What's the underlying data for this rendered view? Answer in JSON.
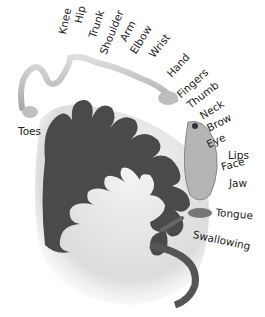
{
  "diagram": {
    "colors": {
      "cortex": "#4a4a4a",
      "brain_fill": "#e6e6e6",
      "body_figure": "#c9c9c9",
      "label": "#222222"
    },
    "labels": [
      {
        "id": "knee",
        "text": "Knee"
      },
      {
        "id": "hip",
        "text": "Hip"
      },
      {
        "id": "trunk",
        "text": "Trunk"
      },
      {
        "id": "shoulder",
        "text": "Shoulder"
      },
      {
        "id": "arm",
        "text": "Arm"
      },
      {
        "id": "elbow",
        "text": "Elbow"
      },
      {
        "id": "wrist",
        "text": "Wrist"
      },
      {
        "id": "hand",
        "text": "Hand"
      },
      {
        "id": "fingers",
        "text": "Fingers"
      },
      {
        "id": "thumb",
        "text": "Thumb"
      },
      {
        "id": "neck",
        "text": "Neck"
      },
      {
        "id": "brow",
        "text": "Brow"
      },
      {
        "id": "eye",
        "text": "Eye"
      },
      {
        "id": "face",
        "text": "Face"
      },
      {
        "id": "lips",
        "text": "Lips"
      },
      {
        "id": "jaw",
        "text": "Jaw"
      },
      {
        "id": "tongue",
        "text": "Tongue"
      },
      {
        "id": "swallowing",
        "text": "Swallowing"
      },
      {
        "id": "toes",
        "text": "Toes"
      }
    ]
  }
}
